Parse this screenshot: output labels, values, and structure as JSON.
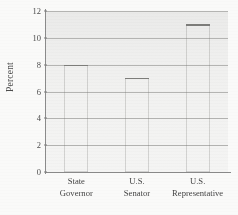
{
  "chart_data": {
    "type": "bar",
    "title": "",
    "subtitle": "",
    "xlabel": "",
    "ylabel": "Percent",
    "categories": [
      "State Governor",
      "U.S. Senator",
      "U.S. Representative"
    ],
    "category_lines": [
      {
        "line1": "State",
        "line2": "Governor"
      },
      {
        "line1": "U.S.",
        "line2": "Senator"
      },
      {
        "line1": "U.S.",
        "line2": "Representative"
      }
    ],
    "values": [
      8,
      7,
      11
    ],
    "ylim": [
      0,
      12
    ],
    "ytick_values": [
      0,
      2,
      4,
      6,
      8,
      10,
      12
    ],
    "ytick_labels": [
      "0",
      "2",
      "4",
      "6",
      "8",
      "10",
      "12"
    ],
    "grid": "horizontal",
    "legend": "none",
    "colors": {
      "bar_light": "#c9c9c7",
      "bar_dark": "#8a8a87",
      "plot_background": "#f1f1f0",
      "gridline": "#b4b4b2",
      "axis": "#8a8a8a",
      "text": "#3f3f3f"
    }
  }
}
